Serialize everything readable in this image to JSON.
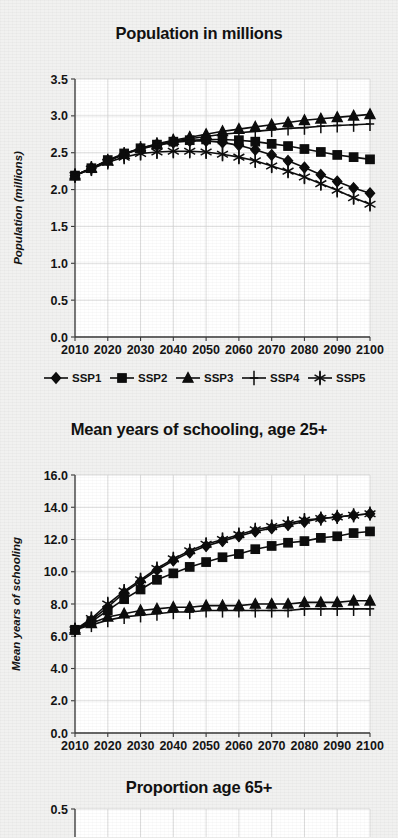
{
  "figure": {
    "background_color": "#f1f1f0",
    "ink_color": "#0d0d0d"
  },
  "legend": {
    "position": "below-first-chart",
    "entries": [
      {
        "label": "SSP1",
        "marker": "diamond"
      },
      {
        "label": "SSP2",
        "marker": "square"
      },
      {
        "label": "SSP3",
        "marker": "triangle"
      },
      {
        "label": "SSP4",
        "marker": "plus"
      },
      {
        "label": "SSP5",
        "marker": "asterisk"
      }
    ]
  },
  "panels": [
    {
      "title": "Population in millions"
    },
    {
      "title": "Mean years of schooling, age 25+"
    },
    {
      "title": "Proportion age 65+"
    }
  ],
  "chart_data": [
    {
      "type": "line",
      "title": "Population in millions",
      "xlabel": "",
      "ylabel": "Population (millions)",
      "xlim": [
        2010,
        2100
      ],
      "ylim": [
        0.0,
        3.5
      ],
      "yticks": [
        "0.0",
        "0.5",
        "1.0",
        "1.5",
        "2.0",
        "2.5",
        "3.0",
        "3.5"
      ],
      "xticks": [
        "2010",
        "2020",
        "2030",
        "2040",
        "2050",
        "2060",
        "2070",
        "2080",
        "2090",
        "2100"
      ],
      "grid": true,
      "legend": [
        "SSP1",
        "SSP2",
        "SSP3",
        "SSP4",
        "SSP5"
      ],
      "x": [
        2010,
        2015,
        2020,
        2025,
        2030,
        2035,
        2040,
        2045,
        2050,
        2055,
        2060,
        2065,
        2070,
        2075,
        2080,
        2085,
        2090,
        2095,
        2100
      ],
      "series": [
        {
          "name": "SSP1",
          "marker": "diamond",
          "values": [
            2.19,
            2.29,
            2.39,
            2.48,
            2.55,
            2.6,
            2.64,
            2.66,
            2.66,
            2.64,
            2.6,
            2.54,
            2.47,
            2.39,
            2.3,
            2.2,
            2.11,
            2.02,
            1.95
          ]
        },
        {
          "name": "SSP2",
          "marker": "square",
          "values": [
            2.19,
            2.29,
            2.4,
            2.49,
            2.56,
            2.61,
            2.65,
            2.67,
            2.68,
            2.68,
            2.67,
            2.65,
            2.62,
            2.59,
            2.55,
            2.51,
            2.47,
            2.44,
            2.41
          ]
        },
        {
          "name": "SSP3",
          "marker": "triangle",
          "values": [
            2.19,
            2.29,
            2.39,
            2.48,
            2.56,
            2.62,
            2.67,
            2.71,
            2.75,
            2.79,
            2.82,
            2.85,
            2.88,
            2.91,
            2.94,
            2.96,
            2.98,
            3.0,
            3.02
          ]
        },
        {
          "name": "SSP4",
          "marker": "plus",
          "values": [
            2.19,
            2.29,
            2.39,
            2.48,
            2.56,
            2.61,
            2.66,
            2.69,
            2.72,
            2.75,
            2.77,
            2.79,
            2.81,
            2.83,
            2.84,
            2.86,
            2.87,
            2.88,
            2.89
          ]
        },
        {
          "name": "SSP5",
          "marker": "asterisk",
          "values": [
            2.19,
            2.28,
            2.37,
            2.44,
            2.49,
            2.51,
            2.52,
            2.52,
            2.51,
            2.48,
            2.44,
            2.39,
            2.32,
            2.25,
            2.17,
            2.08,
            1.99,
            1.89,
            1.8
          ]
        }
      ]
    },
    {
      "type": "line",
      "title": "Mean years of schooling, age 25+",
      "xlabel": "",
      "ylabel": "Mean years of schooling",
      "xlim": [
        2010,
        2100
      ],
      "ylim": [
        0.0,
        16.0
      ],
      "yticks": [
        "0.0",
        "2.0",
        "4.0",
        "6.0",
        "8.0",
        "10.0",
        "12.0",
        "14.0",
        "16.0"
      ],
      "xticks": [
        "2010",
        "2020",
        "2030",
        "2040",
        "2050",
        "2060",
        "2070",
        "2080",
        "2090",
        "2100"
      ],
      "grid": true,
      "legend": [
        "SSP1",
        "SSP2",
        "SSP3",
        "SSP4",
        "SSP5"
      ],
      "x": [
        2010,
        2015,
        2020,
        2025,
        2030,
        2035,
        2040,
        2045,
        2050,
        2055,
        2060,
        2065,
        2070,
        2075,
        2080,
        2085,
        2090,
        2095,
        2100
      ],
      "series": [
        {
          "name": "SSP1",
          "marker": "diamond",
          "values": [
            6.4,
            7.0,
            7.8,
            8.7,
            9.4,
            10.1,
            10.7,
            11.2,
            11.6,
            11.9,
            12.2,
            12.5,
            12.7,
            12.9,
            13.1,
            13.3,
            13.4,
            13.5,
            13.6
          ]
        },
        {
          "name": "SSP2",
          "marker": "square",
          "values": [
            6.4,
            6.9,
            7.6,
            8.3,
            8.9,
            9.5,
            9.9,
            10.3,
            10.6,
            10.9,
            11.1,
            11.4,
            11.6,
            11.8,
            11.9,
            12.1,
            12.2,
            12.4,
            12.5
          ]
        },
        {
          "name": "SSP3",
          "marker": "triangle",
          "values": [
            6.4,
            6.8,
            7.2,
            7.4,
            7.6,
            7.7,
            7.8,
            7.8,
            7.9,
            7.9,
            7.9,
            8.0,
            8.0,
            8.0,
            8.1,
            8.1,
            8.1,
            8.2,
            8.2
          ]
        },
        {
          "name": "SSP4",
          "marker": "plus",
          "values": [
            6.4,
            6.7,
            7.0,
            7.2,
            7.3,
            7.4,
            7.5,
            7.5,
            7.6,
            7.6,
            7.6,
            7.6,
            7.6,
            7.6,
            7.7,
            7.7,
            7.7,
            7.7,
            7.7
          ]
        },
        {
          "name": "SSP5",
          "marker": "asterisk",
          "values": [
            6.4,
            7.1,
            8.0,
            8.8,
            9.5,
            10.2,
            10.8,
            11.3,
            11.7,
            12.0,
            12.3,
            12.6,
            12.8,
            13.0,
            13.2,
            13.3,
            13.4,
            13.5,
            13.6
          ]
        }
      ]
    },
    {
      "type": "line",
      "title": "Proportion age 65+",
      "xlabel": "",
      "ylabel": "",
      "ylim": [
        0.0,
        0.5
      ],
      "yticks": [
        "0.5"
      ],
      "xticks": [],
      "grid": true,
      "note": "panel cropped at bottom edge of screenshot",
      "series": []
    }
  ]
}
